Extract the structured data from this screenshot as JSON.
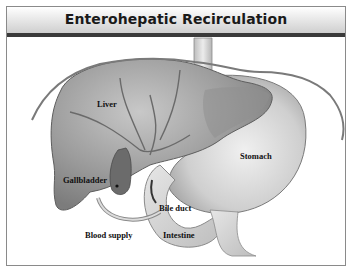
{
  "title": "Enterohepatic Recirculation",
  "labels": {
    "liver": "Liver",
    "stomach": "Stomach",
    "gallbladder": "Gallbladder",
    "bile_duct": "Bile duct",
    "blood_supply": "Blood supply",
    "intestine": "Intestine"
  },
  "colors": {
    "title_rule": "#3a3a3a",
    "organ_fill": "#9a9a9a",
    "outline": "#6e6e6e"
  }
}
